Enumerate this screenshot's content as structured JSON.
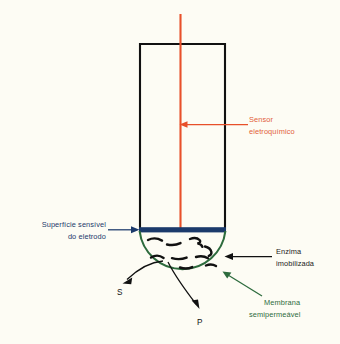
{
  "figure": {
    "background_color": "#fdfcf4"
  },
  "colors": {
    "sensor_red": "#e8502a",
    "sensor_label": "#e2603a",
    "electrode_navy": "#1b3a6b",
    "membrane_green": "#2d6b3d",
    "tube_black": "#111111",
    "enzyme_black": "#111111"
  },
  "labels": {
    "sensor": {
      "line1": "Sensor",
      "line2": "eletroquímico",
      "color": "#e2603a"
    },
    "electrode_surface": {
      "line1": "Superfície sensível",
      "line2": "do eletrodo",
      "color": "#1b3a6b"
    },
    "enzyme": {
      "line1": "Enzima",
      "line2": "imobilizada",
      "color": "#1a1a1a"
    },
    "membrane": {
      "line1": "Membrana",
      "line2": "semipermeável",
      "color": "#2d6b3d"
    },
    "substrate": {
      "text": "S",
      "meaning": "substrato"
    },
    "product": {
      "text": "P",
      "meaning": "produto"
    }
  },
  "parts": {
    "tube": "electrode-body",
    "probe": "electrochemical-sensor-probe",
    "band": "electrode-sensitive-surface",
    "dome": "semipermeable-membrane",
    "squiggles": "immobilized-enzyme-molecules"
  }
}
